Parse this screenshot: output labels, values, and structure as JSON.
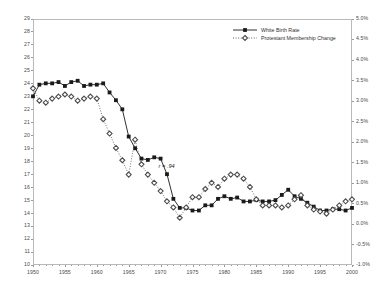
{
  "chart_data": {
    "type": "line",
    "title": "",
    "xlabel": "",
    "ylabel": "",
    "grid": false,
    "legend_position": "top-center",
    "x": [
      1950,
      1951,
      1952,
      1953,
      1954,
      1955,
      1956,
      1957,
      1958,
      1959,
      1960,
      1961,
      1962,
      1963,
      1964,
      1965,
      1966,
      1967,
      1968,
      1969,
      1970,
      1971,
      1972,
      1973,
      1974,
      1975,
      1976,
      1977,
      1978,
      1979,
      1980,
      1981,
      1982,
      1983,
      1984,
      1985,
      1986,
      1987,
      1988,
      1989,
      1990,
      1991,
      1992,
      1993,
      1994,
      1995,
      1996,
      1997,
      1998,
      1999,
      2000
    ],
    "x_ticks": [
      1950,
      1955,
      1960,
      1965,
      1970,
      1975,
      1980,
      1985,
      1990,
      1995,
      2000
    ],
    "xlim": [
      1950,
      2000
    ],
    "axes": [
      {
        "id": "left",
        "name": "White Birth Rate",
        "ylim": [
          10,
          29
        ],
        "ticks": [
          10,
          11,
          12,
          13,
          14,
          15,
          16,
          17,
          18,
          19,
          20,
          21,
          22,
          23,
          24,
          25,
          26,
          27,
          28,
          29
        ],
        "tick_labels": [
          "10",
          "11",
          "12",
          "13",
          "14",
          "15",
          "16",
          "17",
          "18",
          "19",
          "20",
          "21",
          "22",
          "23",
          "24",
          "25",
          "26",
          "27",
          "28",
          "29"
        ]
      },
      {
        "id": "right",
        "name": "Protestant Membership Change",
        "ylim": [
          -1.0,
          5.0
        ],
        "ticks": [
          -1.0,
          -0.5,
          0.0,
          0.5,
          1.0,
          1.5,
          2.0,
          2.5,
          3.0,
          3.5,
          4.0,
          4.5,
          5.0
        ],
        "tick_labels": [
          "-1.0%",
          "-0.5%",
          "0.0%",
          "0.5%",
          "1.0%",
          "1.5%",
          "2.0%",
          "2.5%",
          "3.0%",
          "3.5%",
          "4.0%",
          "4.5%",
          "5.0%"
        ]
      }
    ],
    "series": [
      {
        "name": "White Birth Rate",
        "axis": "left",
        "marker": "square",
        "line_style": "solid",
        "color": "#1a1a1a",
        "values": [
          23.0,
          23.9,
          24.0,
          24.0,
          24.1,
          23.8,
          24.1,
          24.2,
          23.8,
          23.9,
          23.9,
          24.0,
          23.3,
          22.7,
          22.0,
          19.9,
          19.0,
          18.2,
          18.1,
          18.3,
          18.2,
          17.0,
          15.1,
          14.4,
          14.4,
          14.2,
          14.2,
          14.6,
          14.6,
          15.1,
          15.3,
          15.1,
          15.2,
          14.9,
          14.9,
          15.0,
          14.9,
          14.9,
          15.0,
          15.4,
          15.8,
          15.3,
          15.1,
          14.8,
          14.5,
          14.2,
          14.2,
          14.3,
          14.3,
          14.2,
          14.4
        ]
      },
      {
        "name": "Protestant Membership Change",
        "axis": "right",
        "marker": "diamond",
        "line_style": "dotted",
        "color": "#4d4d4d",
        "values": [
          3.3,
          3.0,
          2.95,
          3.05,
          3.1,
          3.15,
          3.1,
          3.0,
          3.05,
          3.1,
          3.05,
          2.55,
          2.2,
          1.85,
          1.55,
          1.2,
          2.05,
          1.45,
          1.2,
          1.0,
          0.8,
          0.55,
          0.4,
          0.15,
          0.4,
          0.65,
          0.65,
          0.85,
          1.0,
          0.9,
          1.1,
          1.2,
          1.2,
          1.1,
          0.9,
          0.6,
          0.45,
          0.45,
          0.45,
          0.4,
          0.45,
          0.6,
          0.7,
          0.45,
          0.35,
          0.3,
          0.25,
          0.35,
          0.45,
          0.55,
          0.6
        ]
      }
    ],
    "annotations": [
      {
        "text": "r = .94",
        "x": 1970,
        "y_left": 17.6
      }
    ]
  },
  "legend": {
    "items": [
      {
        "label": "White Birth Rate",
        "marker": "square",
        "line_style": "solid"
      },
      {
        "label": "Protestant Membership Change",
        "marker": "diamond",
        "line_style": "dotted"
      }
    ]
  }
}
